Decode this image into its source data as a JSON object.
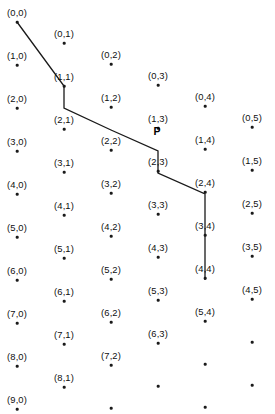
{
  "figure": {
    "kind": "lattice-path-diagram",
    "width": 275,
    "height": 414,
    "background_color": "#ffffff",
    "dot_color": "#1a1a1a",
    "label_color": "#101010",
    "path_color": "#1a1a1a"
  },
  "path": {
    "name": "P",
    "name_x": 157,
    "name_y": 131,
    "stroke_width": 1.3,
    "vertices": [
      {
        "x": 17,
        "y": 22
      },
      {
        "x": 64,
        "y": 86
      },
      {
        "x": 64,
        "y": 108
      },
      {
        "x": 111,
        "y": 130
      },
      {
        "x": 158,
        "y": 151
      },
      {
        "x": 158,
        "y": 173
      },
      {
        "x": 205,
        "y": 194
      },
      {
        "x": 205,
        "y": 280
      }
    ]
  },
  "lattice": {
    "origin_x": 17,
    "origin_y": 22,
    "row_step_x": 0,
    "row_step_y": 43,
    "col_step_x": 47,
    "col_step_y": 21,
    "rows": 10,
    "cols": 6,
    "labeled_points": [
      {
        "label": "(0,0)",
        "row": 0,
        "col": 0
      },
      {
        "label": "(1,0)",
        "row": 1,
        "col": 0
      },
      {
        "label": "(2,0)",
        "row": 2,
        "col": 0
      },
      {
        "label": "(3,0)",
        "row": 3,
        "col": 0
      },
      {
        "label": "(4,0)",
        "row": 4,
        "col": 0
      },
      {
        "label": "(5,0)",
        "row": 5,
        "col": 0
      },
      {
        "label": "(6,0)",
        "row": 6,
        "col": 0
      },
      {
        "label": "(7,0)",
        "row": 7,
        "col": 0
      },
      {
        "label": "(8,0)",
        "row": 8,
        "col": 0
      },
      {
        "label": "(9,0)",
        "row": 9,
        "col": 0
      },
      {
        "label": "(0,1)",
        "row": 0,
        "col": 1
      },
      {
        "label": "(1,1)",
        "row": 1,
        "col": 1
      },
      {
        "label": "(2,1)",
        "row": 2,
        "col": 1
      },
      {
        "label": "(3,1)",
        "row": 3,
        "col": 1
      },
      {
        "label": "(4,1)",
        "row": 4,
        "col": 1
      },
      {
        "label": "(5,1)",
        "row": 5,
        "col": 1
      },
      {
        "label": "(6,1)",
        "row": 6,
        "col": 1
      },
      {
        "label": "(7,1)",
        "row": 7,
        "col": 1
      },
      {
        "label": "(8,1)",
        "row": 8,
        "col": 1
      },
      {
        "label": "(0,2)",
        "row": 0,
        "col": 2
      },
      {
        "label": "(1,2)",
        "row": 1,
        "col": 2
      },
      {
        "label": "(2,2)",
        "row": 2,
        "col": 2
      },
      {
        "label": "(3,2)",
        "row": 3,
        "col": 2
      },
      {
        "label": "(4,2)",
        "row": 4,
        "col": 2
      },
      {
        "label": "(5,2)",
        "row": 5,
        "col": 2
      },
      {
        "label": "(6,2)",
        "row": 6,
        "col": 2
      },
      {
        "label": "(7,2)",
        "row": 7,
        "col": 2
      },
      {
        "label": "(0,3)",
        "row": 0,
        "col": 3
      },
      {
        "label": "(1,3)",
        "row": 1,
        "col": 3
      },
      {
        "label": "(2,3)",
        "row": 2,
        "col": 3
      },
      {
        "label": "(3,3)",
        "row": 3,
        "col": 3
      },
      {
        "label": "(4,3)",
        "row": 4,
        "col": 3
      },
      {
        "label": "(5,3)",
        "row": 5,
        "col": 3
      },
      {
        "label": "(6,3)",
        "row": 6,
        "col": 3
      },
      {
        "label": "(0,4)",
        "row": 0,
        "col": 4
      },
      {
        "label": "(1,4)",
        "row": 1,
        "col": 4
      },
      {
        "label": "(2,4)",
        "row": 2,
        "col": 4
      },
      {
        "label": "(3,4)",
        "row": 3,
        "col": 4
      },
      {
        "label": "(4,4)",
        "row": 4,
        "col": 4
      },
      {
        "label": "(5,4)",
        "row": 5,
        "col": 4
      },
      {
        "label": "(0,5)",
        "row": 0,
        "col": 5
      },
      {
        "label": "(1,5)",
        "row": 1,
        "col": 5
      },
      {
        "label": "(2,5)",
        "row": 2,
        "col": 5
      },
      {
        "label": "(3,5)",
        "row": 3,
        "col": 5
      },
      {
        "label": "(4,5)",
        "row": 4,
        "col": 5
      }
    ]
  }
}
